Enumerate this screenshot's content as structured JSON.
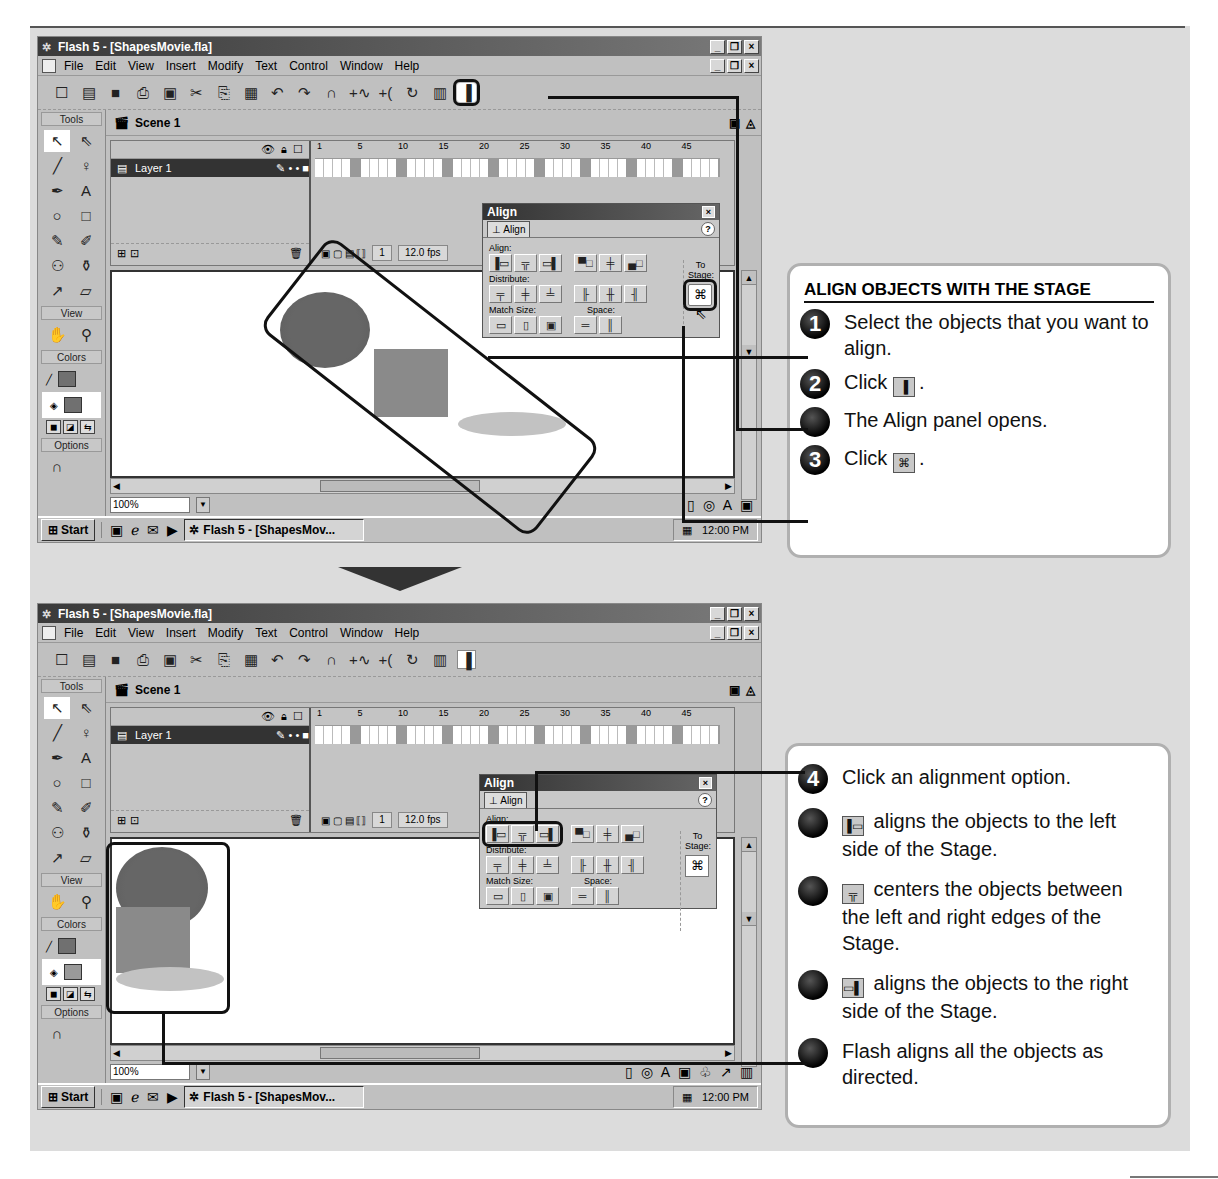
{
  "window": {
    "title": "Flash 5 - [ShapesMovie.fla]",
    "controls": [
      "_",
      "❐",
      "×"
    ],
    "menu": [
      "File",
      "Edit",
      "View",
      "Insert",
      "Modify",
      "Text",
      "Control",
      "Window",
      "Help"
    ],
    "toolbar_icons": [
      "new-icon",
      "open-icon",
      "save-icon",
      "print-icon",
      "print-preview-icon",
      "cut-icon",
      "copy-icon",
      "paste-icon",
      "undo-icon",
      "redo-icon",
      "snap-icon",
      "smooth-icon",
      "straighten-icon",
      "rotate-icon",
      "scale-icon",
      "align-icon"
    ],
    "toolbar_glyphs": [
      "☐",
      "▤",
      "■",
      "⎙",
      "▣",
      "✂",
      "⎘",
      "▦",
      "↶",
      "↷",
      "∩",
      "+∿",
      "+(",
      "↻",
      "▥",
      "▐"
    ],
    "scene_label": "Scene 1",
    "tools_label": "Tools",
    "view_label": "View",
    "colors_label": "Colors",
    "options_label": "Options",
    "tools": [
      {
        "name": "arrow-tool",
        "glyph": "↖"
      },
      {
        "name": "subselect-tool",
        "glyph": "⇖"
      },
      {
        "name": "line-tool",
        "glyph": "╱"
      },
      {
        "name": "lasso-tool",
        "glyph": "♀"
      },
      {
        "name": "pen-tool",
        "glyph": "✒"
      },
      {
        "name": "text-tool",
        "glyph": "A"
      },
      {
        "name": "oval-tool",
        "glyph": "○"
      },
      {
        "name": "rectangle-tool",
        "glyph": "□"
      },
      {
        "name": "pencil-tool",
        "glyph": "✎"
      },
      {
        "name": "brush-tool",
        "glyph": "✐"
      },
      {
        "name": "ink-bottle-tool",
        "glyph": "⚇"
      },
      {
        "name": "paint-bucket-tool",
        "glyph": "⚱"
      },
      {
        "name": "dropper-tool",
        "glyph": "↗"
      },
      {
        "name": "eraser-tool",
        "glyph": "▱"
      }
    ],
    "view_tools": [
      {
        "name": "hand-tool",
        "glyph": "✋"
      },
      {
        "name": "zoom-tool",
        "glyph": "⚲"
      }
    ],
    "timeline": {
      "layer_name": "Layer 1",
      "ruler": [
        "1",
        "5",
        "10",
        "15",
        "20",
        "25",
        "30",
        "35",
        "40",
        "45"
      ],
      "current_frame": "1",
      "frame_rate": "12.0 fps"
    },
    "zoom_level": "100%",
    "taskbar": {
      "start": "Start",
      "task": "Flash 5 - [ShapesMov...",
      "clock": "12:00 PM"
    }
  },
  "align_panel": {
    "title": "Align",
    "tab": "Align",
    "help": "?",
    "align_label": "Align:",
    "distribute_label": "Distribute:",
    "match_size_label": "Match Size:",
    "space_label": "Space:",
    "to_stage_label": "To Stage:",
    "align_buttons": [
      "left-align",
      "center-horizontal",
      "right-align",
      "top-align",
      "center-vertical",
      "bottom-align"
    ],
    "align_glyphs": [
      "▐▭",
      "╦",
      "▭▌",
      "▀□",
      "╪",
      "▄□"
    ],
    "distribute_glyphs": [
      "╤",
      "╪",
      "╧",
      "╟",
      "╫",
      "╢"
    ],
    "match_glyphs": [
      "▭",
      "▯",
      "▣"
    ],
    "space_glyphs": [
      "═",
      "║"
    ],
    "stage_glyph": "⌘"
  },
  "instructions_top": {
    "heading": "ALIGN OBJECTS WITH THE STAGE",
    "steps": [
      {
        "badge": "1",
        "text": "Select the objects that you want to align."
      },
      {
        "badge": "2",
        "text_before": "Click ",
        "icon": "align-icon",
        "glyph": "▐",
        "text_after": "."
      },
      {
        "badge": "",
        "text": "The Align panel opens."
      },
      {
        "badge": "3",
        "text_before": "Click ",
        "icon": "to-stage-icon",
        "glyph": "⌘",
        "text_after": "."
      }
    ]
  },
  "instructions_bottom": {
    "steps": [
      {
        "badge": "4",
        "text": "Click an alignment option."
      },
      {
        "badge": "",
        "icon": "align-left-icon",
        "glyph": "▐▭",
        "text": "aligns the objects to the left side of the Stage."
      },
      {
        "badge": "",
        "icon": "align-center-icon",
        "glyph": "╦",
        "text": "centers the objects between the left and right edges of the Stage."
      },
      {
        "badge": "",
        "icon": "align-right-icon",
        "glyph": "▭▌",
        "text": "aligns the objects to the right side of the Stage."
      },
      {
        "badge": "",
        "text": "Flash aligns all the objects as directed."
      }
    ]
  }
}
